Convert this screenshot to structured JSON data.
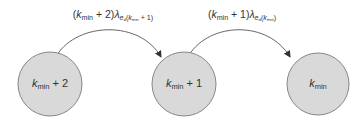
{
  "diagram": {
    "type": "state-transition",
    "colors": {
      "node_fill": "#d9d9d9",
      "node_stroke": "#7a7a7a",
      "edge_stroke": "#555555",
      "text": "#333333"
    },
    "nodes": [
      {
        "id": "kmin_plus_2",
        "base": "k",
        "sub": "min",
        "suffix": " + 2",
        "cx": 50,
        "cy": 84,
        "r": 32
      },
      {
        "id": "kmin_plus_1",
        "base": "k",
        "sub": "min",
        "suffix": " + 1",
        "cx": 184,
        "cy": 84,
        "r": 32
      },
      {
        "id": "kmin",
        "base": "k",
        "sub": "min",
        "suffix": "",
        "cx": 318,
        "cy": 84,
        "r": 31
      }
    ],
    "edges": [
      {
        "from": "kmin_plus_2",
        "to": "kmin_plus_1",
        "label": {
          "open": "(",
          "k": "k",
          "k_sub": "min",
          "plus": " + 2)",
          "lambda": "λ",
          "lambda_sub_base": "e",
          "lambda_sub_sub": "d",
          "lambda_sub_arg_open": "(",
          "lambda_sub_arg_k": "k",
          "lambda_sub_arg_k_sub": "min",
          "lambda_sub_arg_rest": " + 1)"
        }
      },
      {
        "from": "kmin_plus_1",
        "to": "kmin",
        "label": {
          "open": "(",
          "k": "k",
          "k_sub": "min",
          "plus": " + 1)",
          "lambda": "λ",
          "lambda_sub_base": "e",
          "lambda_sub_sub": "d",
          "lambda_sub_arg_open": "(",
          "lambda_sub_arg_k": "k",
          "lambda_sub_arg_k_sub": "min",
          "lambda_sub_arg_rest": ")"
        }
      }
    ]
  }
}
